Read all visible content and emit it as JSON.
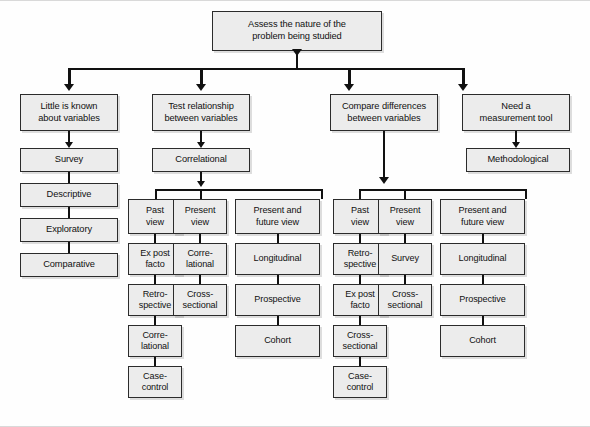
{
  "diagram": {
    "root": {
      "id": "root",
      "label": "Assess the nature of the\nproblem being studied"
    },
    "branches": [
      {
        "id": "branch-little-known",
        "label": "Little is known\nabout variables",
        "chain": [
          {
            "id": "survey",
            "label": "Survey"
          },
          {
            "id": "descriptive",
            "label": "Descriptive"
          },
          {
            "id": "exploratory",
            "label": "Exploratory"
          },
          {
            "id": "comparative",
            "label": "Comparative"
          }
        ]
      },
      {
        "id": "branch-test-relationship",
        "label": "Test relationship\nbetween variables",
        "intermediate": {
          "id": "correlational",
          "label": "Correlational"
        },
        "columns": [
          {
            "id": "col-past-view-left",
            "head": "Past\nview",
            "chain": [
              {
                "id": "ex-post-facto-left",
                "label": "Ex post\nfacto"
              },
              {
                "id": "retrospective-left",
                "label": "Retro-\nspective"
              },
              {
                "id": "correlational-left",
                "label": "Corre-\nlational"
              },
              {
                "id": "case-control-left",
                "label": "Case-\ncontrol"
              }
            ]
          },
          {
            "id": "col-present-view-left",
            "head": "Present\nview",
            "chain": [
              {
                "id": "correlational-present-left",
                "label": "Corre-\nlational"
              },
              {
                "id": "cross-sectional-left",
                "label": "Cross-\nsectional"
              }
            ]
          },
          {
            "id": "col-present-future-left",
            "head": "Present and\nfuture view",
            "chain": [
              {
                "id": "longitudinal-left",
                "label": "Longitudinal"
              },
              {
                "id": "prospective-left",
                "label": "Prospective"
              },
              {
                "id": "cohort-left",
                "label": "Cohort"
              }
            ]
          }
        ]
      },
      {
        "id": "branch-compare-differences",
        "label": "Compare differences\nbetween variables",
        "columns": [
          {
            "id": "col-past-view-right",
            "head": "Past\nview",
            "chain": [
              {
                "id": "retrospective-right",
                "label": "Retro-\nspective"
              },
              {
                "id": "ex-post-facto-right",
                "label": "Ex post\nfacto"
              },
              {
                "id": "cross-sectional-right",
                "label": "Cross-\nsectional"
              },
              {
                "id": "case-control-right",
                "label": "Case-\ncontrol"
              }
            ]
          },
          {
            "id": "col-present-view-right",
            "head": "Present\nview",
            "chain": [
              {
                "id": "survey-right",
                "label": "Survey"
              },
              {
                "id": "cross-sectional-present-right",
                "label": "Cross-\nsectional"
              }
            ]
          },
          {
            "id": "col-present-future-right",
            "head": "Present and\nfuture view",
            "chain": [
              {
                "id": "longitudinal-right",
                "label": "Longitudinal"
              },
              {
                "id": "prospective-right",
                "label": "Prospective"
              },
              {
                "id": "cohort-right",
                "label": "Cohort"
              }
            ]
          }
        ]
      },
      {
        "id": "branch-measurement-tool",
        "label": "Need a\nmeasurement tool",
        "chain": [
          {
            "id": "methodological",
            "label": "Methodological"
          }
        ]
      }
    ],
    "colors": {
      "box_fill": "#ececec",
      "box_border": "#2b2b2b",
      "connector": "#111111",
      "background": "#fefefe"
    }
  }
}
